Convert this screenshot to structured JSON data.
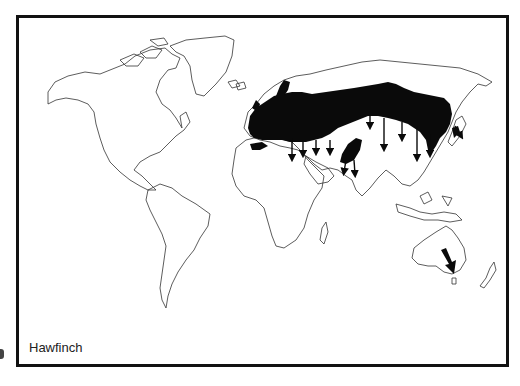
{
  "map": {
    "title": "Hawfinch",
    "subject": "Hawfinch breeding range and migration",
    "legend": {
      "range_fill": "black filled area = breeding range",
      "arrows": "arrows = migration direction"
    },
    "colors": {
      "outline": "#333333",
      "range": "#0a0a0a",
      "frame": "#111111",
      "background": "#ffffff"
    },
    "arrows": [
      {
        "id": "europe-1",
        "from": [
          292,
          147
        ],
        "to": [
          292,
          160
        ]
      },
      {
        "id": "turkey-1",
        "from": [
          302,
          149
        ],
        "to": [
          302,
          160
        ]
      },
      {
        "id": "arabia-1",
        "from": [
          315,
          143
        ],
        "to": [
          315,
          158
        ]
      },
      {
        "id": "caspian-1",
        "from": [
          330,
          146
        ],
        "to": [
          330,
          158
        ]
      },
      {
        "id": "india-1",
        "from": [
          348,
          160
        ],
        "to": [
          345,
          175
        ]
      },
      {
        "id": "india-2",
        "from": [
          355,
          163
        ],
        "to": [
          355,
          178
        ]
      },
      {
        "id": "siberia-1",
        "from": [
          372,
          115
        ],
        "to": [
          372,
          130
        ]
      },
      {
        "id": "china-1",
        "from": [
          383,
          115
        ],
        "to": [
          383,
          152
        ]
      },
      {
        "id": "china-2",
        "from": [
          403,
          118
        ],
        "to": [
          403,
          140
        ]
      },
      {
        "id": "china-3",
        "from": [
          418,
          120
        ],
        "to": [
          418,
          160
        ]
      },
      {
        "id": "korea-1",
        "from": [
          432,
          130
        ],
        "to": [
          432,
          158
        ]
      },
      {
        "id": "japan-1",
        "from": [
          454,
          125
        ],
        "to": [
          460,
          135
        ]
      },
      {
        "id": "australia-1",
        "from": [
          444,
          249
        ],
        "to": [
          452,
          268
        ]
      }
    ]
  }
}
